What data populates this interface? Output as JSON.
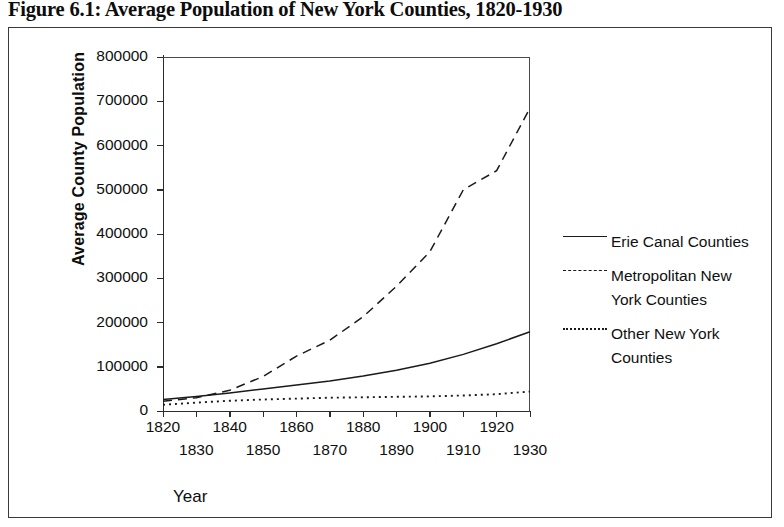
{
  "figure": {
    "title": "Figure 6.1: Average Population of New York Counties, 1820-1930"
  },
  "axis": {
    "y_title": "Average County Population",
    "x_title": "Year",
    "y_ticks": [
      "800000",
      "700000",
      "600000",
      "500000",
      "400000",
      "300000",
      "200000",
      "100000",
      "0"
    ],
    "x_ticks_upper": [
      "1820",
      "1840",
      "1860",
      "1880",
      "1900",
      "1920"
    ],
    "x_ticks_lower": [
      "1830",
      "1850",
      "1870",
      "1890",
      "1910",
      "1930"
    ]
  },
  "legend": {
    "entries": [
      {
        "label": "Erie Canal Counties",
        "style": "solid"
      },
      {
        "label": "Metropolitan New",
        "label2": "York Counties",
        "style": "dashed"
      },
      {
        "label": "Other New York",
        "label2": "Counties",
        "style": "dotted"
      }
    ]
  },
  "colors": {
    "line": "#1a1a1a",
    "axis": "#2b2b2b",
    "frame": "#3a3a3a",
    "background": "#ffffff"
  },
  "chart_data": {
    "type": "line",
    "title": "Figure 6.1: Average Population of New York Counties, 1820-1930",
    "xlabel": "Year",
    "ylabel": "Average County Population",
    "xlim": [
      1820,
      1930
    ],
    "ylim": [
      0,
      800000
    ],
    "grid": false,
    "legend_position": "right",
    "x": [
      1820,
      1830,
      1840,
      1850,
      1860,
      1870,
      1880,
      1890,
      1900,
      1910,
      1920,
      1930
    ],
    "series": [
      {
        "name": "Erie Canal Counties",
        "style": "solid",
        "values": [
          26000,
          33000,
          41000,
          50000,
          59000,
          68000,
          79000,
          92000,
          108000,
          128000,
          152000,
          179000
        ]
      },
      {
        "name": "Metropolitan New York Counties",
        "style": "dashed",
        "values": [
          22000,
          30000,
          47000,
          78000,
          124000,
          160000,
          213000,
          282000,
          360000,
          500000,
          543000,
          685000
        ]
      },
      {
        "name": "Other New York Counties",
        "style": "dotted",
        "values": [
          14000,
          19000,
          23000,
          26000,
          28000,
          30000,
          31000,
          32000,
          33000,
          35000,
          38000,
          44000
        ]
      }
    ]
  }
}
